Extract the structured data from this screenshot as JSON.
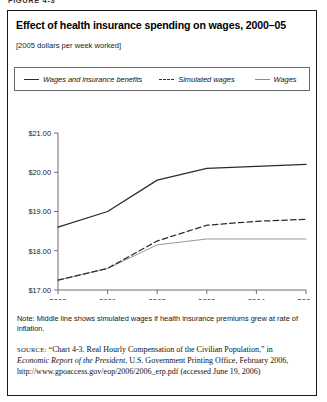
{
  "figure": {
    "label": "FIGURE 4-3",
    "title": "Effect of health insurance spending on wages, 2000–05",
    "subtitle": "[2005 dollars per week worked]"
  },
  "legend": {
    "items": [
      {
        "label": "Wages and insurance benefits",
        "style": "solid",
        "color": "#2b2b2b"
      },
      {
        "label": "Simulated wages",
        "style": "dashed",
        "color": "#2b2b2b"
      },
      {
        "label": "Wages",
        "style": "thin",
        "color": "#8d8d8d"
      }
    ]
  },
  "notes": {
    "note_label": "Note:",
    "note_text": "Middle line shows simulated wages if health insurance premiums grew at rate of inflation.",
    "source_label": "source:",
    "source_text_1": "“Chart 4-3. Real Hourly Compensation of the Civilian Population,” in ",
    "source_italic": "Economic Report of the President",
    "source_text_2": ", U.S. Government Printing Office, February 2006, http://www.gpoaccess.gov/eop/2006/2006_erp.pdf (accessed June 19, 2006)"
  },
  "chart_data": {
    "type": "line",
    "title": "Effect of health insurance spending on wages, 2000–05",
    "subtitle": "[2005 dollars per week worked]",
    "xlabel": "",
    "ylabel": "",
    "x": [
      2000,
      2001,
      2002,
      2003,
      2004,
      2005
    ],
    "categories": [
      "2000",
      "2001",
      "2002",
      "2003",
      "2004",
      "2005"
    ],
    "xtick_labels": [
      "2000",
      "2001",
      "2002",
      "2003",
      "2004",
      "2005"
    ],
    "ytick_labels": [
      "$21.00",
      "$20.00",
      "$19.00",
      "$18.00",
      "$17.00"
    ],
    "ytick_values": [
      21.0,
      20.0,
      19.0,
      18.0,
      17.0
    ],
    "ylim": [
      17.0,
      21.0
    ],
    "xlim": [
      2000,
      2005
    ],
    "grid": false,
    "legend_position": "above-plot",
    "series": [
      {
        "name": "Wages and insurance benefits",
        "style": "solid",
        "color": "#2b2b2b",
        "values": [
          18.6,
          19.0,
          19.8,
          20.1,
          20.15,
          20.2
        ]
      },
      {
        "name": "Simulated wages",
        "style": "dashed",
        "color": "#2b2b2b",
        "values": [
          17.25,
          17.55,
          18.25,
          18.65,
          18.75,
          18.8
        ]
      },
      {
        "name": "Wages",
        "style": "thin-solid",
        "color": "#8d8d8d",
        "values": [
          17.25,
          17.55,
          18.15,
          18.3,
          18.3,
          18.3
        ]
      }
    ],
    "annotations": [
      "Middle line shows simulated wages if health insurance premiums grew at rate of inflation."
    ]
  }
}
